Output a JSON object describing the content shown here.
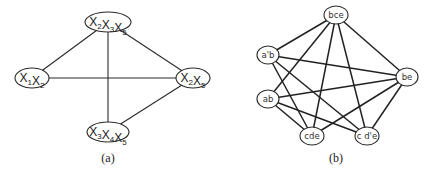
{
  "diagram_a": {
    "caption": "(a)",
    "nodes": [
      {
        "id": "n1",
        "label_parts": [
          [
            "X",
            "2"
          ],
          [
            "X",
            "3"
          ],
          [
            "X",
            "5"
          ]
        ],
        "label": "X2X3X5",
        "x": 108,
        "y": 22,
        "rx": 23,
        "ry": 10
      },
      {
        "id": "n2",
        "label_parts": [
          [
            "X",
            "1"
          ],
          [
            "X",
            "2"
          ]
        ],
        "label": "X1X2",
        "x": 32,
        "y": 78,
        "rx": 17,
        "ry": 10
      },
      {
        "id": "n3",
        "label_parts": [
          [
            "X",
            "2"
          ],
          [
            "X",
            "5"
          ]
        ],
        "label": "X2X5",
        "x": 193,
        "y": 78,
        "rx": 17,
        "ry": 10
      },
      {
        "id": "n4",
        "label_parts": [
          [
            "X",
            "3"
          ],
          [
            "X",
            "4"
          ],
          [
            "X",
            "5"
          ]
        ],
        "label": "X3X4X5",
        "x": 108,
        "y": 132,
        "rx": 21,
        "ry": 10
      }
    ],
    "edges": [
      [
        "n1",
        "n2"
      ],
      [
        "n1",
        "n3"
      ],
      [
        "n1",
        "n4"
      ],
      [
        "n2",
        "n3"
      ],
      [
        "n3",
        "n4"
      ]
    ]
  },
  "diagram_b": {
    "caption": "(b)",
    "nodes": [
      {
        "id": "bce",
        "label": "bce",
        "x": 336,
        "y": 15,
        "rx": 12,
        "ry": 9
      },
      {
        "id": "apb",
        "label": "a'b",
        "x": 268,
        "y": 55,
        "rx": 11,
        "ry": 9
      },
      {
        "id": "be",
        "label": "be",
        "x": 407,
        "y": 77,
        "rx": 11,
        "ry": 9
      },
      {
        "id": "ab",
        "label": "ab",
        "x": 268,
        "y": 99,
        "rx": 11,
        "ry": 9
      },
      {
        "id": "cde",
        "label": "cde",
        "x": 312,
        "y": 136,
        "rx": 12,
        "ry": 9
      },
      {
        "id": "cdpe",
        "label": "c d'e",
        "x": 367,
        "y": 136,
        "rx": 12,
        "ry": 9
      }
    ],
    "edges": [
      [
        "bce",
        "apb"
      ],
      [
        "bce",
        "ab"
      ],
      [
        "bce",
        "cde"
      ],
      [
        "bce",
        "cdpe"
      ],
      [
        "bce",
        "be"
      ],
      [
        "apb",
        "be"
      ],
      [
        "apb",
        "cde"
      ],
      [
        "apb",
        "cdpe"
      ],
      [
        "ab",
        "be"
      ],
      [
        "ab",
        "cde"
      ],
      [
        "ab",
        "cdpe"
      ],
      [
        "be",
        "cde"
      ],
      [
        "be",
        "cdpe"
      ]
    ]
  }
}
